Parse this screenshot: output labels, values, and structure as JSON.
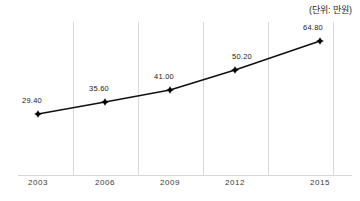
{
  "chart_data": {
    "type": "line",
    "title": "",
    "subtitle": "",
    "unit_note": "(단위: 만원)",
    "xlabel": "",
    "ylabel": "",
    "categories": [
      "2003",
      "2006",
      "2009",
      "2012",
      "2015"
    ],
    "values": [
      29.4,
      35.6,
      41.0,
      50.2,
      64.8
    ],
    "point_labels": [
      "29.40",
      "35.60",
      "41.00",
      "50.20",
      "64.80"
    ],
    "series": [
      {
        "name": "",
        "values": [
          29.4,
          35.6,
          41.0,
          50.2,
          64.8
        ]
      }
    ],
    "ylim": [
      0,
      70
    ],
    "xlim": [
      "2003",
      "2015"
    ],
    "grid": {
      "vertical": true,
      "horizontal": false,
      "color": "#d9d9d9"
    },
    "legend": {
      "visible": false,
      "position": "none",
      "entries": []
    },
    "marker": "diamond",
    "line_color": "#111111",
    "marker_color": "#000000",
    "axis_color": "#d6d6d6",
    "label_color": "#222222"
  },
  "geometry": {
    "points": [
      {
        "x": 38,
        "y": 114
      },
      {
        "x": 105,
        "y": 102
      },
      {
        "x": 170,
        "y": 90
      },
      {
        "x": 235,
        "y": 70
      },
      {
        "x": 320,
        "y": 41
      }
    ],
    "gridline_x": [
      73,
      138,
      203,
      268,
      333
    ],
    "tick_x": [
      38,
      105,
      170,
      235,
      320
    ],
    "label_offsets": [
      {
        "x": 32,
        "y": 96
      },
      {
        "x": 99,
        "y": 84
      },
      {
        "x": 164,
        "y": 72
      },
      {
        "x": 242,
        "y": 52
      },
      {
        "x": 313,
        "y": 23
      }
    ]
  }
}
